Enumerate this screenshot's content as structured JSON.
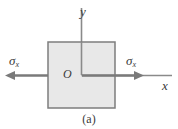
{
  "figure": {
    "caption": "(a)",
    "colors": {
      "element_fill": "#e8e8e8",
      "element_stroke": "#7d7d7d",
      "axis_stroke": "#8a8a8a",
      "arrow_stroke": "#7a7a7a",
      "text": "#3a3a3a",
      "background": "#ffffff"
    },
    "element": {
      "shape": "square",
      "x": 48,
      "y": 42,
      "width": 67,
      "height": 66
    },
    "axes": [
      {
        "name": "y-axis",
        "label": "y",
        "x1": 81,
        "y1": 8,
        "x2": 81,
        "y2": 75
      },
      {
        "name": "x-axis",
        "label": "x",
        "x1": 81,
        "y1": 75,
        "x2": 172,
        "y2": 75
      }
    ],
    "origin_label": "O",
    "stresses": [
      {
        "name": "sigma-x-left",
        "symbol": "σ",
        "subscript": "x",
        "direction": "left",
        "tail_x": 48,
        "tip_x": 5,
        "y": 75,
        "label_x": 9,
        "label_y": 54
      },
      {
        "name": "sigma-x-right",
        "symbol": "σ",
        "subscript": "x",
        "direction": "right",
        "tail_x": 110,
        "tip_x": 144,
        "y": 75,
        "label_x": 126,
        "label_y": 54
      }
    ]
  }
}
